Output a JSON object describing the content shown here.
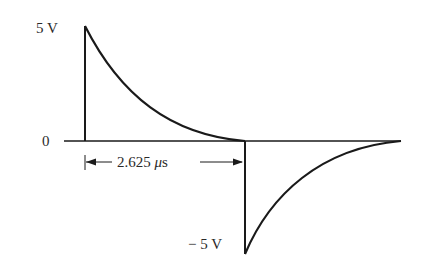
{
  "diagram": {
    "type": "waveform",
    "labels": {
      "positive_peak": "5 V",
      "zero": "0",
      "negative_peak": "− 5 V",
      "duration_value": "2.625 ",
      "duration_unit_mu": "μ",
      "duration_unit_s": "s"
    },
    "annotation": {
      "duration": "2.625 μs",
      "type": "dimension-arrow"
    },
    "colors": {
      "stroke": "#1a1a1a",
      "text": "#2a2a2a",
      "background": "#ffffff"
    }
  }
}
